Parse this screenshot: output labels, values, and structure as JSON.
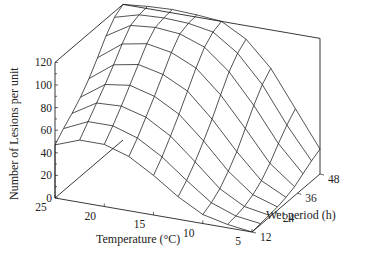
{
  "chart_data": {
    "type": "surface",
    "title": "",
    "xlabel": "Temperature (°C)",
    "ylabel": "Wet period (h)",
    "zlabel": "Number of Lesions per unit",
    "x_ticks": [
      "25",
      "20",
      "15",
      "10",
      "5"
    ],
    "y_ticks": [
      "12",
      "24",
      "36",
      "48"
    ],
    "z_ticks": [
      "0",
      "20",
      "40",
      "60",
      "80",
      "100",
      "120"
    ],
    "zlim": [
      0,
      120
    ],
    "xlim": [
      25,
      5
    ],
    "ylim": [
      12,
      48
    ],
    "grid": false,
    "x": [
      25,
      22.5,
      20,
      17.5,
      15,
      12.5,
      10,
      7.5,
      5
    ],
    "y": [
      12,
      16.5,
      21,
      25.5,
      30,
      34.5,
      39,
      43.5,
      48
    ],
    "z": [
      [
        47,
        55,
        55,
        48,
        35,
        20,
        8,
        3,
        0
      ],
      [
        55,
        65,
        65,
        58,
        45,
        28,
        12,
        4,
        1
      ],
      [
        62,
        75,
        76,
        70,
        57,
        38,
        18,
        6,
        2
      ],
      [
        70,
        85,
        88,
        82,
        70,
        50,
        27,
        10,
        3
      ],
      [
        80,
        96,
        100,
        95,
        84,
        63,
        38,
        16,
        5
      ],
      [
        92,
        108,
        112,
        108,
        98,
        78,
        52,
        25,
        8
      ],
      [
        105,
        118,
        120,
        118,
        110,
        92,
        66,
        36,
        13
      ],
      [
        115,
        121,
        122,
        121,
        117,
        102,
        78,
        46,
        18
      ],
      [
        120,
        122,
        123,
        122,
        120,
        108,
        86,
        54,
        22
      ]
    ]
  }
}
